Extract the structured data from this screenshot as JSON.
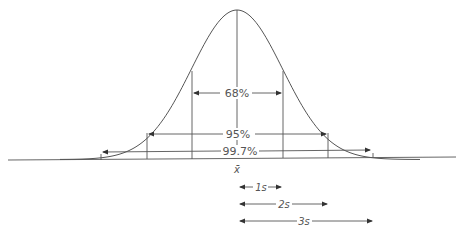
{
  "diagram": {
    "type": "normal-distribution",
    "mean_label": "x̄",
    "intervals": [
      {
        "label": "68%",
        "range_sd": 1
      },
      {
        "label": "95%",
        "range_sd": 2
      },
      {
        "label": "99.7%",
        "range_sd": 3
      }
    ],
    "sd_scale": [
      {
        "label": "1s",
        "sd": 1
      },
      {
        "label": "2s",
        "sd": 2
      },
      {
        "label": "3s",
        "sd": 3
      }
    ],
    "colors": {
      "line": "#555555",
      "background": "#ffffff"
    }
  }
}
